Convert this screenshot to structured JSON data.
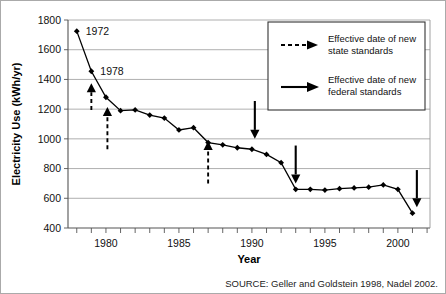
{
  "chart_data": {
    "type": "line",
    "title": "",
    "xlabel": "Year",
    "ylabel": "Electricity Use (kWh/yr)",
    "xlim": [
      1977.4,
      2002.2
    ],
    "ylim": [
      400,
      1800
    ],
    "ytick_values": [
      400,
      600,
      800,
      1000,
      1200,
      1400,
      1600,
      1800
    ],
    "ytick_labels": [
      "400",
      "600",
      "800",
      "1000",
      "1200",
      "1400",
      "1600",
      "1800"
    ],
    "xtick_values": [
      1980,
      1985,
      1990,
      1995,
      2000
    ],
    "xtick_labels": [
      "1980",
      "1985",
      "1990",
      "1995",
      "2000"
    ],
    "xtick_minor_step": 1,
    "grid": "horizontal",
    "legend_position": "upper-right",
    "series": [
      {
        "name": "Average new refrigerator electricity use",
        "x": [
          1978,
          1979,
          1980,
          1981,
          1982,
          1983,
          1984,
          1985,
          1986,
          1987,
          1988,
          1989,
          1990,
          1991,
          1992,
          1993,
          1994,
          1995,
          1996,
          1997,
          1998,
          1999,
          2000,
          2001
        ],
        "y": [
          1725,
          1455,
          1280,
          1190,
          1195,
          1160,
          1140,
          1060,
          1075,
          975,
          960,
          940,
          930,
          895,
          840,
          660,
          660,
          655,
          665,
          670,
          675,
          690,
          660,
          500
        ]
      }
    ],
    "point_annotations": [
      {
        "label": "1972",
        "x": 1978,
        "y": 1725
      },
      {
        "label": "1978",
        "x": 1979,
        "y": 1455
      }
    ],
    "arrows": [
      {
        "style": "dashed",
        "kind": "state",
        "x": 1979.0,
        "y_from": 1195,
        "y_to": 1375
      },
      {
        "style": "dashed",
        "kind": "state",
        "x": 1980.1,
        "y_from": 930,
        "y_to": 1215
      },
      {
        "style": "dashed",
        "kind": "state",
        "x": 1987.0,
        "y_from": 700,
        "y_to": 985
      },
      {
        "style": "solid",
        "kind": "federal",
        "x": 1990.2,
        "y_from": 1255,
        "y_to": 1000
      },
      {
        "style": "solid",
        "kind": "federal",
        "x": 1993.0,
        "y_from": 955,
        "y_to": 700
      },
      {
        "style": "solid",
        "kind": "federal",
        "x": 2001.3,
        "y_from": 790,
        "y_to": 540
      }
    ]
  },
  "legend": {
    "entries": [
      {
        "marker": "dashed-arrow",
        "line1": "Effective date of new",
        "line2": "state standards"
      },
      {
        "marker": "solid-arrow",
        "line1": "Effective date of new",
        "line2": "federal standards"
      }
    ]
  },
  "footer": {
    "source": "SOURCE: Geller and Goldstein 1998, Nadel 2002."
  }
}
